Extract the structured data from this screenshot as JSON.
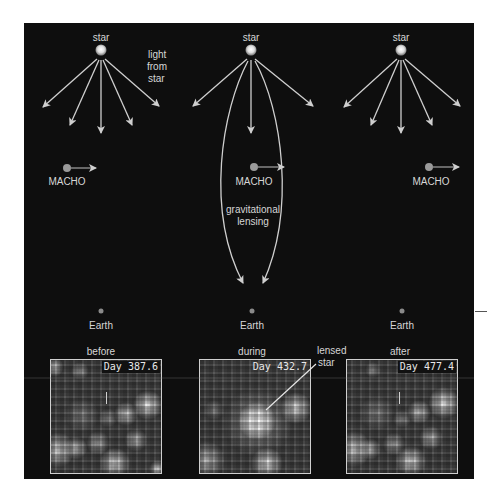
{
  "columns": [
    {
      "id": "before",
      "star_label": "star",
      "macho_label": "MACHO",
      "earth_label": "Earth",
      "phase_label": "before",
      "day_label": "Day 387.6"
    },
    {
      "id": "during",
      "star_label": "star",
      "macho_label": "MACHO",
      "lensing_label_line1": "gravitational",
      "lensing_label_line2": "lensing",
      "earth_label": "Earth",
      "phase_label": "during",
      "day_label": "Day 432.7",
      "callout_line1": "lensed",
      "callout_line2": "star"
    },
    {
      "id": "after",
      "star_label": "star",
      "macho_label": "MACHO",
      "earth_label": "Earth",
      "phase_label": "after",
      "day_label": "Day 477.4"
    }
  ],
  "annotations": {
    "light_line1": "light",
    "light_line2": "from",
    "light_line3": "star"
  },
  "colors": {
    "panel": "#0e0e0e",
    "text": "#d6d6d6",
    "ray": "#cfcfcf",
    "macho": "#9a9a9a",
    "earth": "#8a8a8a"
  }
}
